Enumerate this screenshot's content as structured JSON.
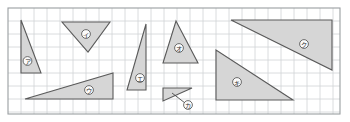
{
  "figure": {
    "background_color": "#ffffff",
    "fill_color": "#d6d6d6",
    "stroke_color": "#5a5a5a",
    "grid_line_color": "#d0d3d6",
    "grid_border_color": "#9a9ea1",
    "grid": {
      "x": 8,
      "y": 8,
      "width": 332,
      "height": 106,
      "cell_size": 13,
      "columns": 25,
      "rows": 8
    }
  },
  "shapes": [
    {
      "id": "triangle-a",
      "label": "ア",
      "points": "21,20 21,73 41,73",
      "label_x": 27.5,
      "label_y": 61,
      "leader": null
    },
    {
      "id": "triangle-i",
      "label": "イ",
      "points": "62,22 110,22 88,52",
      "label_x": 86,
      "label_y": 34,
      "leader": null
    },
    {
      "id": "triangle-u",
      "label": "ウ",
      "points": "25,99 113,99 113,73",
      "label_x": 89,
      "label_y": 90,
      "leader": null
    },
    {
      "id": "triangle-e",
      "label": "エ",
      "points": "146,24 146,90 127,90",
      "label_x": 140,
      "label_y": 78,
      "leader": null
    },
    {
      "id": "triangle-o",
      "label": "オ",
      "points": "176,21 198,63 163,63",
      "label_x": 179,
      "label_y": 48,
      "leader": null
    },
    {
      "id": "triangle-ka",
      "label": "カ",
      "points": "163,88 192,88 163,101",
      "label_x": 188,
      "label_y": 105,
      "leader": "172,93 185,103"
    },
    {
      "id": "triangle-ki",
      "label": "キ",
      "points": "216,50 216,100 293,100",
      "label_x": 237,
      "label_y": 82,
      "leader": null
    },
    {
      "id": "triangle-ku",
      "label": "ク",
      "points": "231,20 332,20 332,70",
      "label_x": 304,
      "label_y": 44,
      "leader": null
    }
  ]
}
